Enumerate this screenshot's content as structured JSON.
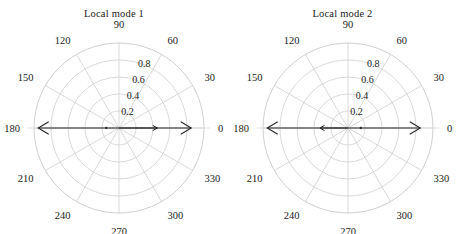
{
  "figure": {
    "background": "#ffffff",
    "grid_color": "#c9c9c9",
    "axis_color": "#d4d4d4",
    "arrow_color": "#262626",
    "text_color": "#1a1a1a"
  },
  "panels": [
    {
      "title": "Local mode 1"
    },
    {
      "title": "Local mode 2"
    }
  ],
  "angle_ticks": [
    "0",
    "30",
    "60",
    "90",
    "120",
    "150",
    "180",
    "210",
    "240",
    "270",
    "300",
    "330"
  ],
  "radial_ticks": [
    "0.2",
    "0.4",
    "0.6",
    "0.8"
  ],
  "chart_data": [
    {
      "type": "polar-quiver",
      "title": "Local mode 1",
      "rlim": [
        0,
        1.0
      ],
      "rticks": [
        0.2,
        0.4,
        0.6,
        0.8
      ],
      "rtick_labels": [
        "0.2",
        "0.4",
        "0.6",
        "0.8"
      ],
      "theta_ticks": [
        0,
        30,
        60,
        90,
        120,
        150,
        180,
        210,
        240,
        270,
        300,
        330
      ],
      "theta_tick_labels": [
        "0",
        "30",
        "60",
        "90",
        "120",
        "150",
        "180",
        "210",
        "240",
        "270",
        "300",
        "330"
      ],
      "theta_direction": "counterclockwise",
      "theta_zero_location": "E",
      "grid": true,
      "legend": "none",
      "xlabel": "",
      "ylabel": "",
      "vectors": [
        {
          "theta_deg": 180,
          "r": 0.95,
          "direction": "outward",
          "head": "large",
          "label": "mode-1 large arrow at 180 deg"
        },
        {
          "theta_deg": 180,
          "r": 0.15,
          "direction": "point",
          "head": "dot",
          "label": "mode-1 small marker near centre (180 deg side)"
        },
        {
          "theta_deg": 0,
          "r": 0.45,
          "direction": "outward",
          "head": "small",
          "label": "mode-1 small arrow at 0 deg"
        },
        {
          "theta_deg": 0,
          "r": 0.85,
          "direction": "outward",
          "head": "large",
          "label": "mode-1 large arrow at 0 deg"
        }
      ]
    },
    {
      "type": "polar-quiver",
      "title": "Local mode 2",
      "rlim": [
        0,
        1.0
      ],
      "rticks": [
        0.2,
        0.4,
        0.6,
        0.8
      ],
      "rtick_labels": [
        "0.2",
        "0.4",
        "0.6",
        "0.8"
      ],
      "theta_ticks": [
        0,
        30,
        60,
        90,
        120,
        150,
        180,
        210,
        240,
        270,
        300,
        330
      ],
      "theta_tick_labels": [
        "0",
        "30",
        "60",
        "90",
        "120",
        "150",
        "180",
        "210",
        "240",
        "270",
        "300",
        "330"
      ],
      "theta_direction": "counterclockwise",
      "theta_zero_location": "E",
      "grid": true,
      "legend": "none",
      "xlabel": "",
      "ylabel": "",
      "vectors": [
        {
          "theta_deg": 180,
          "r": 0.95,
          "direction": "outward",
          "head": "large",
          "label": "mode-2 large arrow at 180 deg"
        },
        {
          "theta_deg": 180,
          "r": 0.33,
          "direction": "outward",
          "head": "small",
          "label": "mode-2 small arrow at 180 deg"
        },
        {
          "theta_deg": 0,
          "r": 0.15,
          "direction": "point",
          "head": "dot",
          "label": "mode-2 small marker near centre (0 deg side)"
        },
        {
          "theta_deg": 0,
          "r": 0.85,
          "direction": "outward",
          "head": "large",
          "label": "mode-2 large arrow at 0 deg"
        }
      ]
    }
  ]
}
